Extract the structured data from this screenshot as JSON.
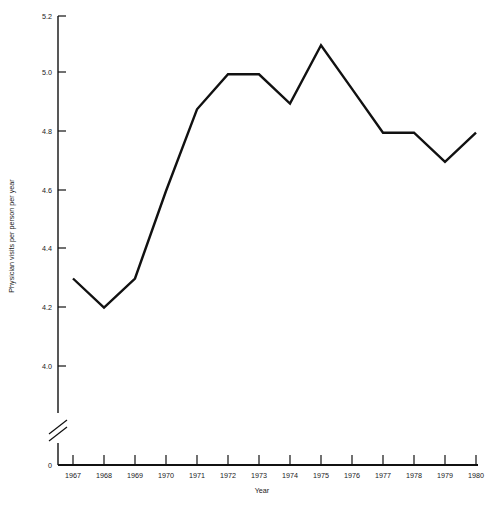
{
  "chart_data": {
    "type": "line",
    "title": "",
    "xlabel": "Year",
    "ylabel": "Physician visits per person per year",
    "x": [
      1967,
      1968,
      1969,
      1970,
      1971,
      1972,
      1973,
      1974,
      1975,
      1976,
      1977,
      1978,
      1979,
      1980
    ],
    "categories": [
      "1967",
      "1968",
      "1969",
      "1970",
      "1971",
      "1972",
      "1973",
      "1974",
      "1975",
      "1976",
      "1977",
      "1978",
      "1979",
      "1980"
    ],
    "values": [
      4.3,
      4.2,
      4.3,
      4.6,
      4.88,
      5.0,
      5.0,
      4.9,
      5.1,
      4.95,
      4.8,
      4.8,
      4.7,
      4.8
    ],
    "series": [
      {
        "name": "Physician visits per person per year",
        "values": [
          4.3,
          4.2,
          4.3,
          4.6,
          4.88,
          5.0,
          5.0,
          4.9,
          5.1,
          4.95,
          4.8,
          4.8,
          4.7,
          4.8
        ]
      }
    ],
    "ylim": [
      4.0,
      5.2
    ],
    "yticks": [
      "5.2",
      "5.0",
      "4.8",
      "4.6",
      "4.4",
      "4.2",
      "4.0"
    ],
    "ytick_values": [
      5.2,
      5.0,
      4.8,
      4.6,
      4.4,
      4.2,
      4.0
    ],
    "y_origin_label": "0",
    "axis_break": true,
    "xticks": [
      "1967",
      "1968",
      "1969",
      "1970",
      "1971",
      "1972",
      "1973",
      "1974",
      "1975",
      "1976",
      "1977",
      "1978",
      "1979",
      "1980"
    ],
    "grid": false,
    "legend": "none",
    "line_color": "#111111",
    "background_color": "#ffffff"
  },
  "axes": {
    "x_axis_title": "Year",
    "y_axis_title": "Physician visits per person per year"
  }
}
